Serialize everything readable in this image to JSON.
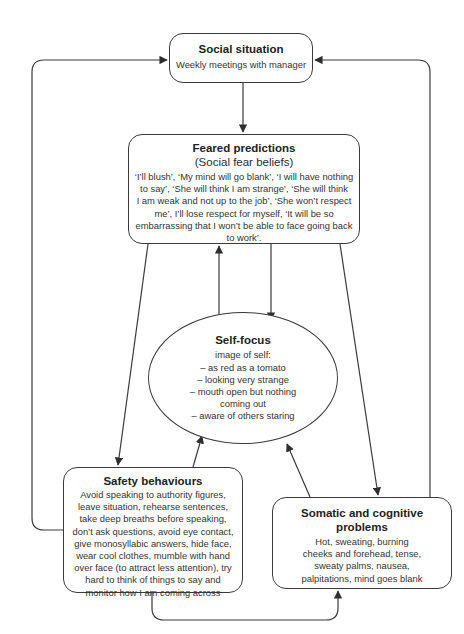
{
  "diagram": {
    "type": "cognitive-model-flowchart",
    "nodes": {
      "social_situation": {
        "title": "Social situation",
        "body": "Weekly meetings with manager"
      },
      "feared_predictions": {
        "title": "Feared predictions",
        "subtitle": "(Social fear beliefs)",
        "body_lines": [
          "‘I’ll blush’, ‘My mind will go blank’, ‘I will have nothing",
          "to say’, ‘She will think I am strange’, ‘She will think",
          "I am weak and not up to the job’, ‘She won’t respect",
          "me’, I’ll lose respect for myself, ‘It will be so",
          "embarrassing that I won’t be able to face going back",
          "to work’."
        ]
      },
      "self_focus": {
        "title": "Self-focus",
        "body_lines": [
          "image of self:",
          "– as red as a tomato",
          "– looking very strange",
          "– mouth open but nothing",
          "coming out",
          "– aware of others staring"
        ]
      },
      "safety_behaviours": {
        "title": "Safety behaviours",
        "body_lines": [
          "Avoid speaking to authority figures,",
          "leave situation, rehearse sentences,",
          "take deep breaths before speaking,",
          "don’t ask questions, avoid eye contact,",
          "give monosyllabic answers, hide face,",
          "wear cool clothes, mumble with hand",
          "over face (to attract less attention), try",
          "hard to think of things to say and",
          "monitor how I am coming across"
        ]
      },
      "somatic_cognitive": {
        "title_lines": [
          "Somatic and cognitive",
          "problems"
        ],
        "body_lines": [
          "Hot, sweating, burning",
          "cheeks and forehead, tense,",
          "sweaty palms, nausea,",
          "palpitations, mind goes blank"
        ]
      }
    },
    "edges": [
      {
        "from": "social_situation",
        "to": "feared_predictions"
      },
      {
        "from": "feared_predictions",
        "to": "self_focus"
      },
      {
        "from": "self_focus",
        "to": "feared_predictions"
      },
      {
        "from": "feared_predictions",
        "to": "safety_behaviours"
      },
      {
        "from": "feared_predictions",
        "to": "somatic_cognitive"
      },
      {
        "from": "safety_behaviours",
        "to": "self_focus"
      },
      {
        "from": "somatic_cognitive",
        "to": "self_focus"
      },
      {
        "from": "safety_behaviours",
        "to": "social_situation"
      },
      {
        "from": "somatic_cognitive",
        "to": "social_situation"
      },
      {
        "from": "safety_behaviours",
        "to": "somatic_cognitive"
      }
    ],
    "colors": {
      "stroke": "#3a3a3a",
      "background": "#ffffff",
      "text": "#2a2a2a"
    }
  }
}
